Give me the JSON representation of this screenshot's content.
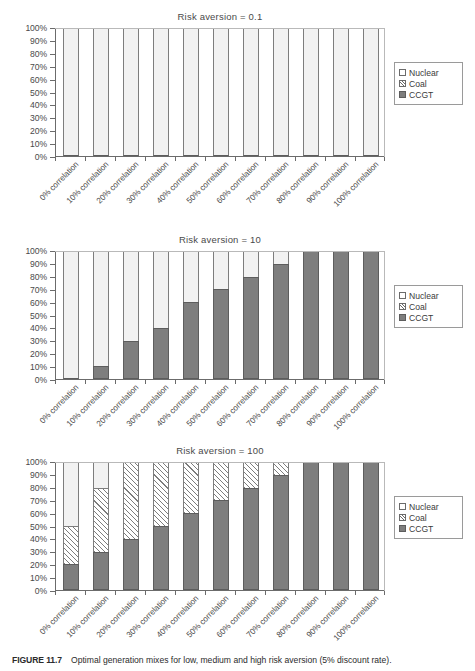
{
  "figure": {
    "caption_label": "FIGURE 11.7",
    "caption_text": "Optimal generation mixes for low, medium and high risk aversion (5% discount rate)."
  },
  "legend": {
    "items": [
      {
        "label": "Nuclear",
        "swatch": "nuclear-swatch-icon",
        "color": "#f2f2f2"
      },
      {
        "label": "Coal",
        "swatch": "coal-swatch-icon",
        "color": "#ffffff"
      },
      {
        "label": "CCGT",
        "swatch": "ccgt-swatch-icon",
        "color": "#7e7e7e"
      }
    ]
  },
  "y_axis": {
    "ticks": [
      "100%",
      "90%",
      "80%",
      "70%",
      "60%",
      "50%",
      "40%",
      "30%",
      "20%",
      "10%",
      "0%"
    ]
  },
  "x_axis": {
    "categories": [
      "0% correlation",
      "10% correlation",
      "20% correlation",
      "30% correlation",
      "40% correlation",
      "50% correlation",
      "60% correlation",
      "70% correlation",
      "80% correlation",
      "90% correlation",
      "100% correlation"
    ]
  },
  "chart_data": [
    {
      "type": "bar",
      "stacked": true,
      "title": "Risk aversion = 0.1",
      "xlabel": "",
      "ylabel": "",
      "ylim": [
        0,
        100
      ],
      "ytick_step": 10,
      "grid": false,
      "legend_position": "right",
      "categories": [
        "0% correlation",
        "10% correlation",
        "20% correlation",
        "30% correlation",
        "40% correlation",
        "50% correlation",
        "60% correlation",
        "70% correlation",
        "80% correlation",
        "90% correlation",
        "100% correlation"
      ],
      "series": [
        {
          "name": "CCGT",
          "values": [
            0,
            0,
            0,
            0,
            0,
            0,
            0,
            0,
            0,
            0,
            0
          ]
        },
        {
          "name": "Coal",
          "values": [
            0,
            0,
            0,
            0,
            0,
            0,
            0,
            0,
            0,
            0,
            0
          ]
        },
        {
          "name": "Nuclear",
          "values": [
            100,
            100,
            100,
            100,
            100,
            100,
            100,
            100,
            100,
            100,
            100
          ]
        }
      ]
    },
    {
      "type": "bar",
      "stacked": true,
      "title": "Risk aversion = 10",
      "xlabel": "",
      "ylabel": "",
      "ylim": [
        0,
        100
      ],
      "ytick_step": 10,
      "grid": false,
      "legend_position": "right",
      "categories": [
        "0% correlation",
        "10% correlation",
        "20% correlation",
        "30% correlation",
        "40% correlation",
        "50% correlation",
        "60% correlation",
        "70% correlation",
        "80% correlation",
        "90% correlation",
        "100% correlation"
      ],
      "series": [
        {
          "name": "CCGT",
          "values": [
            0,
            10,
            30,
            40,
            60,
            70,
            80,
            90,
            100,
            100,
            100
          ]
        },
        {
          "name": "Coal",
          "values": [
            0,
            0,
            0,
            0,
            0,
            0,
            0,
            0,
            0,
            0,
            0
          ]
        },
        {
          "name": "Nuclear",
          "values": [
            100,
            90,
            70,
            60,
            40,
            30,
            20,
            10,
            0,
            0,
            0
          ]
        }
      ]
    },
    {
      "type": "bar",
      "stacked": true,
      "title": "Risk aversion = 100",
      "xlabel": "",
      "ylabel": "",
      "ylim": [
        0,
        100
      ],
      "ytick_step": 10,
      "grid": false,
      "legend_position": "right",
      "categories": [
        "0% correlation",
        "10% correlation",
        "20% correlation",
        "30% correlation",
        "40% correlation",
        "50% correlation",
        "60% correlation",
        "70% correlation",
        "80% correlation",
        "90% correlation",
        "100% correlation"
      ],
      "series": [
        {
          "name": "CCGT",
          "values": [
            20,
            30,
            40,
            50,
            60,
            70,
            80,
            90,
            100,
            100,
            100
          ]
        },
        {
          "name": "Coal",
          "values": [
            30,
            50,
            60,
            50,
            40,
            30,
            20,
            10,
            0,
            0,
            0
          ]
        },
        {
          "name": "Nuclear",
          "values": [
            50,
            20,
            0,
            0,
            0,
            0,
            0,
            0,
            0,
            0,
            0
          ]
        }
      ]
    }
  ]
}
